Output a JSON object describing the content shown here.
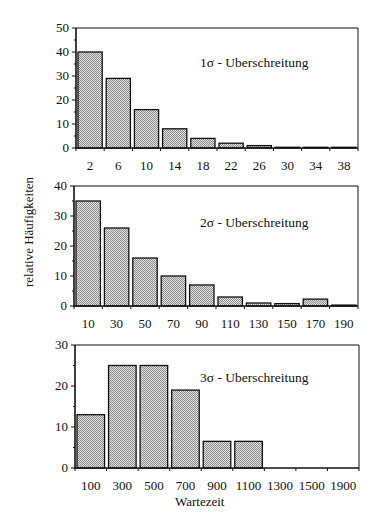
{
  "ylabel": "relative Häufigkeiten",
  "xlabel": "Wartezeit",
  "colors": {
    "bar_fill": "#c8c8c8",
    "bar_stroke": "#111111",
    "frame": "#111111",
    "background": "#ffffff"
  },
  "chart_data": [
    {
      "type": "bar",
      "title": "1σ - Uberschreitung",
      "categories": [
        "2",
        "6",
        "10",
        "14",
        "18",
        "22",
        "26",
        "30",
        "34",
        "38"
      ],
      "values": [
        40,
        29,
        16,
        8,
        4,
        2,
        1,
        0.3,
        0.3,
        0.3
      ],
      "ylim": [
        0,
        50
      ],
      "yticks": [
        0,
        10,
        20,
        30,
        40,
        50
      ],
      "xlabel": "",
      "ylabel": "relative Häufigkeiten",
      "grid": false,
      "layout": {
        "left": 76,
        "right": 358,
        "top": 28,
        "bottom": 148,
        "xlabel_y": 170,
        "title_x": 200,
        "title_y": 67
      }
    },
    {
      "type": "bar",
      "title": "2σ - Uberschreitung",
      "categories": [
        "10",
        "30",
        "50",
        "70",
        "90",
        "110",
        "130",
        "150",
        "170",
        "190"
      ],
      "values": [
        35,
        26,
        16,
        10,
        7,
        3,
        1,
        0.8,
        2.3,
        0.3
      ],
      "ylim": [
        0,
        40
      ],
      "yticks": [
        0,
        10,
        20,
        30,
        40
      ],
      "xlabel": "",
      "ylabel": "relative Häufigkeiten",
      "grid": false,
      "layout": {
        "left": 74,
        "right": 358,
        "top": 186,
        "bottom": 306,
        "xlabel_y": 328,
        "title_x": 200,
        "title_y": 227
      }
    },
    {
      "type": "bar",
      "title": "3σ - Uberschreitung",
      "categories": [
        "100",
        "300",
        "500",
        "700",
        "900",
        "1100",
        "1300",
        "1500",
        "1900"
      ],
      "values": [
        13,
        25,
        25,
        19,
        6.5,
        6.5,
        0,
        0,
        0
      ],
      "ylim": [
        0,
        30
      ],
      "yticks": [
        0,
        10,
        20,
        30
      ],
      "xlabel": "Wartezeit",
      "ylabel": "relative Häufigkeiten",
      "grid": false,
      "layout": {
        "left": 75,
        "right": 359,
        "top": 345,
        "bottom": 468,
        "xlabel_y": 490,
        "title_x": 200,
        "title_y": 382
      }
    }
  ]
}
